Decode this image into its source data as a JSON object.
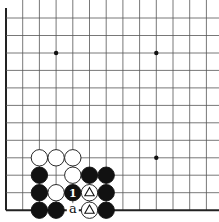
{
  "board": {
    "cols": [
      6,
      22.7,
      39.4,
      56.1,
      72.8,
      89.5,
      106.2,
      122.9,
      139.6,
      156.3,
      173,
      189.7,
      206.4
    ],
    "rows": [
      18,
      35.5,
      53,
      70.4,
      87.9,
      105.4,
      122.8,
      140.3,
      157.8,
      175.2,
      192.7,
      210.2
    ],
    "left_edge": true,
    "bottom_edge": true,
    "star_points": [
      [
        3,
        2
      ],
      [
        9,
        2
      ],
      [
        9,
        8
      ]
    ],
    "line_color": "#555555",
    "edge_color": "#222222"
  },
  "stones": [
    {
      "c": 2,
      "r": 8,
      "color": "white"
    },
    {
      "c": 3,
      "r": 8,
      "color": "white"
    },
    {
      "c": 4,
      "r": 8,
      "color": "white"
    },
    {
      "c": 2,
      "r": 9,
      "color": "black"
    },
    {
      "c": 4,
      "r": 9,
      "color": "white"
    },
    {
      "c": 5,
      "r": 9,
      "color": "black"
    },
    {
      "c": 6,
      "r": 9,
      "color": "black"
    },
    {
      "c": 2,
      "r": 10,
      "color": "black"
    },
    {
      "c": 3,
      "r": 10,
      "color": "white"
    },
    {
      "c": 4,
      "r": 10,
      "color": "black",
      "label": "1"
    },
    {
      "c": 5,
      "r": 10,
      "color": "white",
      "mark": "triangle"
    },
    {
      "c": 6,
      "r": 10,
      "color": "black"
    },
    {
      "c": 2,
      "r": 11,
      "color": "black"
    },
    {
      "c": 3,
      "r": 11,
      "color": "black"
    },
    {
      "c": 5,
      "r": 11,
      "color": "white",
      "mark": "triangle"
    },
    {
      "c": 6,
      "r": 11,
      "color": "black"
    }
  ],
  "labels": [
    {
      "c": 4,
      "r": 11,
      "text": "a"
    }
  ]
}
